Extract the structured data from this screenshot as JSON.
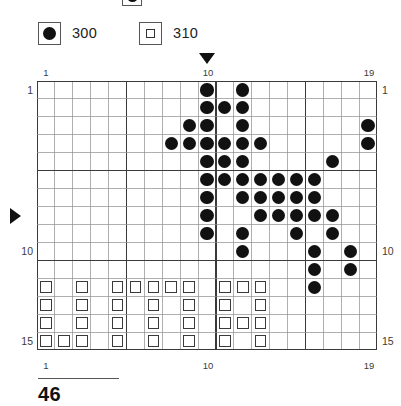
{
  "legend": {
    "cutoff_entry": {
      "symbol": "dot",
      "label": ""
    },
    "entries": [
      {
        "symbol": "dot",
        "symbol_name": "filled-circle",
        "label": "300"
      },
      {
        "symbol": "square",
        "symbol_name": "open-square",
        "label": "310"
      }
    ]
  },
  "footer": {
    "page_number": "46"
  },
  "markers": {
    "top_arrow": {
      "glyph": "▼",
      "column": 10
    },
    "left_arrow": {
      "glyph": "▶",
      "row": 8
    }
  },
  "axis": {
    "top_labels": [
      {
        "text": "1",
        "column": 1
      },
      {
        "text": "10",
        "column": 10
      },
      {
        "text": "19",
        "column": 19
      }
    ],
    "bottom_labels": [
      {
        "text": "1",
        "column": 1
      },
      {
        "text": "10",
        "column": 10
      },
      {
        "text": "19",
        "column": 19
      }
    ],
    "left_labels": [
      {
        "text": "1",
        "row": 1
      },
      {
        "text": "10",
        "row": 10
      },
      {
        "text": "15",
        "row": 15
      }
    ],
    "right_labels": [
      {
        "text": "1",
        "row": 1
      },
      {
        "text": "10",
        "row": 10
      },
      {
        "text": "15",
        "row": 15
      }
    ]
  },
  "chart_data": {
    "type": "heatmap",
    "title": "",
    "xlabel": "",
    "ylabel": "",
    "columns": 19,
    "rows": 15,
    "grid_on": true,
    "bold_gridlines": {
      "every": 5,
      "columns": [
        1,
        6,
        11,
        16,
        20
      ],
      "rows": [
        1,
        6,
        11,
        16
      ]
    },
    "legend_position": "top-left",
    "symbols": {
      "dot": "300",
      "square": "310",
      "empty": ""
    },
    "cells": [
      [
        "",
        "",
        "",
        "",
        "",
        "",
        "",
        "",
        "",
        "dot",
        "",
        "dot",
        "",
        "",
        "",
        "",
        "",
        "",
        ""
      ],
      [
        "",
        "",
        "",
        "",
        "",
        "",
        "",
        "",
        "",
        "dot",
        "dot",
        "dot",
        "",
        "",
        "",
        "",
        "",
        "",
        ""
      ],
      [
        "",
        "",
        "",
        "",
        "",
        "",
        "",
        "",
        "dot",
        "dot",
        "",
        "dot",
        "",
        "",
        "",
        "",
        "",
        "",
        "dot"
      ],
      [
        "",
        "",
        "",
        "",
        "",
        "",
        "",
        "dot",
        "dot",
        "dot",
        "dot",
        "dot",
        "dot",
        "",
        "",
        "",
        "",
        "",
        "dot"
      ],
      [
        "",
        "",
        "",
        "",
        "",
        "",
        "",
        "",
        "",
        "dot",
        "dot",
        "dot",
        "",
        "",
        "",
        "",
        "dot",
        "",
        ""
      ],
      [
        "",
        "",
        "",
        "",
        "",
        "",
        "",
        "",
        "",
        "dot",
        "dot",
        "dot",
        "dot",
        "dot",
        "dot",
        "dot",
        "",
        "",
        ""
      ],
      [
        "",
        "",
        "",
        "",
        "",
        "",
        "",
        "",
        "",
        "dot",
        "",
        "dot",
        "dot",
        "dot",
        "dot",
        "dot",
        "",
        "",
        ""
      ],
      [
        "",
        "",
        "",
        "",
        "",
        "",
        "",
        "",
        "",
        "dot",
        "",
        "",
        "dot",
        "dot",
        "dot",
        "dot",
        "dot",
        "",
        ""
      ],
      [
        "",
        "",
        "",
        "",
        "",
        "",
        "",
        "",
        "",
        "dot",
        "",
        "dot",
        "",
        "",
        "dot",
        "",
        "dot",
        "",
        ""
      ],
      [
        "",
        "",
        "",
        "",
        "",
        "",
        "",
        "",
        "",
        "",
        "",
        "dot",
        "",
        "",
        "",
        "dot",
        "",
        "dot",
        ""
      ],
      [
        "",
        "",
        "",
        "",
        "",
        "",
        "",
        "",
        "",
        "",
        "",
        "",
        "",
        "",
        "",
        "dot",
        "",
        "dot",
        ""
      ],
      [
        "sq",
        "",
        "sq",
        "",
        "sq",
        "sq",
        "sq",
        "sq",
        "sq",
        "",
        "sq",
        "sq",
        "sq",
        "",
        "",
        "dot",
        "",
        "",
        ""
      ],
      [
        "sq",
        "",
        "sq",
        "",
        "sq",
        "",
        "sq",
        "",
        "sq",
        "",
        "sq",
        "",
        "sq",
        "",
        "",
        "",
        "",
        "",
        ""
      ],
      [
        "sq",
        "",
        "sq",
        "",
        "sq",
        "",
        "sq",
        "",
        "sq",
        "",
        "sq",
        "sq",
        "sq",
        "",
        "",
        "",
        "",
        "",
        ""
      ],
      [
        "sq",
        "sq",
        "sq",
        "",
        "sq",
        "",
        "sq",
        "",
        "sq",
        "",
        "sq",
        "",
        "sq",
        "",
        "",
        "",
        "",
        "",
        ""
      ]
    ]
  }
}
